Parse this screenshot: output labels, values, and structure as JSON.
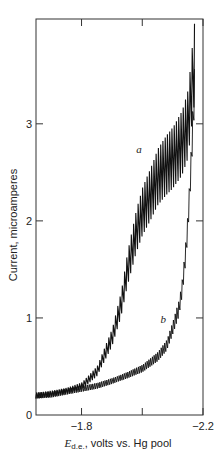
{
  "chart_data": {
    "type": "line",
    "title": "",
    "xlabel_main": "E",
    "xlabel_sub": "d.e.",
    "xlabel_rest": ", volts vs. Hg pool",
    "ylabel": "Current, microamperes",
    "xlim": [
      -1.65,
      -2.2
    ],
    "ylim": [
      0,
      4.08
    ],
    "x_ticks": [
      {
        "value": -1.8,
        "label": "−1.8"
      },
      {
        "value": -2.0,
        "label": ""
      },
      {
        "value": -2.2,
        "label": "−2.2"
      }
    ],
    "y_ticks": [
      {
        "value": 0,
        "label": "0"
      },
      {
        "value": 1,
        "label": "1"
      },
      {
        "value": 2,
        "label": "2"
      },
      {
        "value": 3,
        "label": "3"
      }
    ],
    "grid": false,
    "legend": "none",
    "series": [
      {
        "name": "a",
        "label_at": {
          "x": -1.98,
          "y": 2.7
        },
        "oscillation_amplitude_fraction": 0.12,
        "x": [
          -1.65,
          -1.7,
          -1.75,
          -1.8,
          -1.85,
          -1.9,
          -1.93,
          -1.95,
          -1.98,
          -2.0,
          -2.03,
          -2.05,
          -2.08,
          -2.1,
          -2.13,
          -2.15,
          -2.17
        ],
        "y": [
          0.2,
          0.22,
          0.25,
          0.3,
          0.45,
          0.8,
          1.15,
          1.5,
          1.9,
          2.1,
          2.3,
          2.45,
          2.58,
          2.65,
          2.8,
          3.0,
          3.6
        ]
      },
      {
        "name": "b",
        "label_at": {
          "x": -2.06,
          "y": 0.95
        },
        "oscillation_amplitude_fraction": 0.08,
        "x": [
          -1.65,
          -1.7,
          -1.75,
          -1.8,
          -1.85,
          -1.9,
          -1.95,
          -2.0,
          -2.05,
          -2.08,
          -2.1,
          -2.12,
          -2.13,
          -2.14,
          -2.15,
          -2.16,
          -2.17
        ],
        "y": [
          0.2,
          0.21,
          0.24,
          0.27,
          0.3,
          0.35,
          0.41,
          0.48,
          0.6,
          0.72,
          0.9,
          1.1,
          1.3,
          1.6,
          2.0,
          2.6,
          3.3
        ]
      }
    ]
  }
}
